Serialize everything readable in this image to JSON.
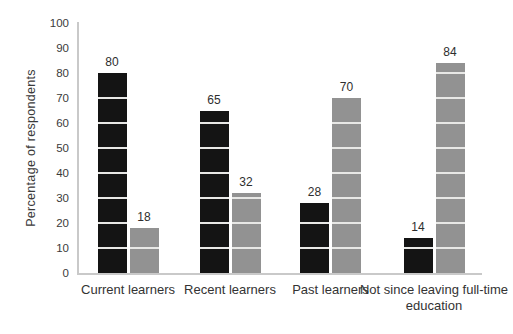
{
  "chart_data": {
    "type": "bar",
    "title": "",
    "xlabel": "",
    "ylabel": "Percentage of respondents",
    "ylim": [
      0,
      100
    ],
    "yticks": [
      0,
      10,
      20,
      30,
      40,
      50,
      60,
      70,
      80,
      90,
      100
    ],
    "grid": "horizontal gridlines visible only as light lines across the bars",
    "legend_position": "none",
    "categories": [
      "Current learners",
      "Recent learners",
      "Past learners",
      "Not since leaving full-time education"
    ],
    "series": [
      {
        "name": "black-series",
        "color": "#141414",
        "values": [
          80,
          65,
          28,
          14
        ]
      },
      {
        "name": "gray-series",
        "color": "#929292",
        "values": [
          18,
          32,
          70,
          84
        ]
      }
    ],
    "bar_value_labels": {
      "black-series": [
        "80",
        "65",
        "28",
        "14"
      ],
      "gray-series": [
        "18",
        "32",
        "70",
        "84"
      ]
    },
    "colors": {
      "black_bar": "#141414",
      "gray_bar": "#929292",
      "axis_line": "#c9c9c9",
      "gridline_on_bar": "#e8e8e6",
      "text": "#333333",
      "background": "#ffffff"
    }
  }
}
